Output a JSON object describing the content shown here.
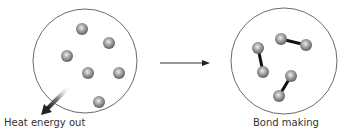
{
  "diagram": {
    "left_panel": {
      "label": "Heat energy out",
      "atom_count": 6,
      "arrow_icon": "heat-out-arrow-icon"
    },
    "transition_arrow": "right-arrow-icon",
    "right_panel": {
      "label": "Bond making",
      "molecule_count": 3,
      "atoms_per_molecule": 2
    },
    "colors": {
      "outline": "#444444",
      "atom_dark": "#6a6a6a",
      "atom_light": "#e8e8e8",
      "bond": "#111111",
      "text": "#333333"
    }
  }
}
